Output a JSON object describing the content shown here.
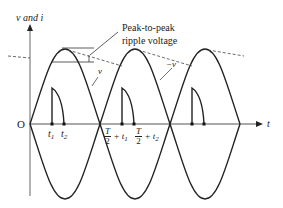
{
  "diagram": {
    "type": "full-wave rectifier with capacitor filter waveform",
    "axes": {
      "y_label": "v and i",
      "x_label": "t",
      "origin_label": "O"
    },
    "annotations": {
      "ripple_label_line1": "Peak-to-peak",
      "ripple_label_line2": "ripple voltage",
      "v_label": "v",
      "neg_v_label": "−v"
    },
    "time_labels": {
      "t1": "t",
      "t1_sub": "1",
      "t2": "t",
      "t2_sub": "2",
      "half_t1_num": "T",
      "half_t1_den": "2",
      "half_t1_suffix": "+ t",
      "half_t1_sub": "1",
      "half_t2_num": "T",
      "half_t2_den": "2",
      "half_t2_suffix": "+ t",
      "half_t2_sub": "2"
    },
    "colors": {
      "curve": "#222222",
      "axis": "#555555",
      "dashed": "#444444"
    }
  }
}
